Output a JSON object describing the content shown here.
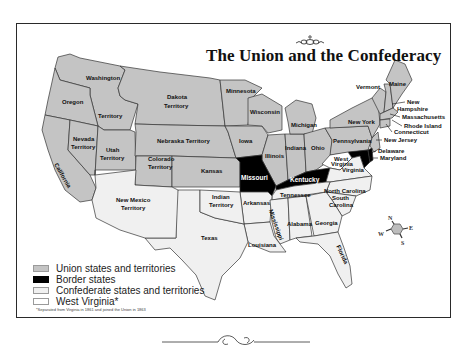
{
  "map": {
    "title": "The Union and the Confederacy",
    "colors": {
      "union": "#c4c4c4",
      "border": "#000000",
      "confederate": "#f0f0f0",
      "west_virginia": "#ffffff",
      "outline": "#333333",
      "frame": "#2a2a2a"
    },
    "regions": {
      "union": [
        "Washington Territory",
        "Oregon",
        "California",
        "Nevada Territory",
        "Utah Territory",
        "Colorado Territory",
        "Dakota Territory",
        "Nebraska Territory",
        "Kansas",
        "Minnesota",
        "Iowa",
        "Wisconsin",
        "Illinois",
        "Indiana",
        "Michigan",
        "Ohio",
        "Pennsylvania",
        "New York",
        "Vermont",
        "New Hampshire",
        "Maine",
        "Massachusetts",
        "Rhode Island",
        "Connecticut",
        "New Jersey"
      ],
      "border": [
        "Missouri",
        "Kentucky",
        "Maryland",
        "Delaware"
      ],
      "confederate": [
        "Virginia",
        "North Carolina",
        "South Carolina",
        "Georgia",
        "Florida",
        "Alabama",
        "Mississippi",
        "Louisiana",
        "Tennessee",
        "Arkansas",
        "Texas"
      ],
      "confederate_territories": [
        "New Mexico Territory",
        "Indian Territory"
      ],
      "west_virginia": [
        "West Virginia"
      ]
    },
    "labels": {
      "washington": "Washington",
      "territory_wa": "Territory",
      "oregon": "Oregon",
      "california": "California",
      "nevada1": "Nevada",
      "nevada2": "Territory",
      "utah1": "Utah",
      "utah2": "Territory",
      "colorado1": "Colorado",
      "colorado2": "Territory",
      "dakota1": "Dakota",
      "dakota2": "Territory",
      "nebraska": "Nebraska Territory",
      "kansas": "Kansas",
      "minnesota": "Minnesota",
      "iowa": "Iowa",
      "wisconsin": "Wisconsin",
      "illinois": "Illinois",
      "indiana": "Indiana",
      "michigan": "Michigan",
      "ohio": "Ohio",
      "pennsylvania": "Pennsylvania",
      "new_york": "New York",
      "vermont": "Vermont",
      "maine": "Maine",
      "new_hampshire1": "New",
      "new_hampshire2": "Hampshire",
      "massachusetts": "Massachusetts",
      "rhode_island": "Rhode Island",
      "connecticut": "Connecticut",
      "new_jersey": "New Jersey",
      "delaware": "Delaware",
      "maryland": "Maryland",
      "missouri": "Missouri",
      "kentucky": "Kentucky",
      "west_virginia1": "West",
      "west_virginia2": "Virginia",
      "virginia": "Virginia",
      "north_carolina": "North Carolina",
      "south_carolina1": "South",
      "south_carolina2": "Carolina",
      "tennessee": "Tennessee",
      "arkansas": "Arkansas",
      "mississippi": "Mississippi",
      "alabama": "Alabama",
      "georgia": "Georgia",
      "florida": "Florida",
      "louisiana": "Louisiana",
      "texas": "Texas",
      "indian1": "Indian",
      "indian2": "Territory",
      "new_mexico1": "New Mexico",
      "new_mexico2": "Territory"
    },
    "compass": {
      "n": "N",
      "e": "E",
      "s": "S",
      "w": "W"
    }
  },
  "legend": {
    "items": [
      {
        "label": "Union states and territories",
        "color": "#c4c4c4"
      },
      {
        "label": "Border states",
        "color": "#000000"
      },
      {
        "label": "Confederate states and territories",
        "color": "#f0f0f0"
      },
      {
        "label": "West Virginia*",
        "color": "#ffffff"
      }
    ],
    "footnote": "*Separated from Virginia in 1861 and joined the Union in 1863"
  }
}
